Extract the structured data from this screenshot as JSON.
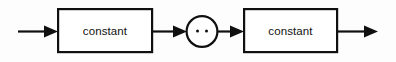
{
  "diagram": {
    "type": "railroad-syntax-diagram",
    "title": "",
    "background_color": "#fdfdfd",
    "line_color": "#101010",
    "fill_color": "#ffffff",
    "nodes": [
      {
        "id": "entry-arrow",
        "kind": "arrow",
        "label": "",
        "icon": "arrow-right-icon"
      },
      {
        "id": "box-constant-left",
        "kind": "terminal-box",
        "label": "constant",
        "x": 57,
        "y": 8,
        "width": 96,
        "height": 45
      },
      {
        "id": "connector-arrow-1",
        "kind": "arrow",
        "label": "",
        "icon": "arrow-right-icon"
      },
      {
        "id": "circle-range",
        "kind": "operator-circle",
        "label": "..",
        "cx": 202,
        "cy": 31,
        "r": 16
      },
      {
        "id": "connector-arrow-2",
        "kind": "arrow",
        "label": "",
        "icon": "arrow-right-icon"
      },
      {
        "id": "box-constant-right",
        "kind": "terminal-box",
        "label": "constant",
        "x": 243,
        "y": 8,
        "width": 95,
        "height": 45
      },
      {
        "id": "exit-arrow",
        "kind": "arrow",
        "label": "",
        "icon": "arrow-right-icon"
      }
    ]
  }
}
